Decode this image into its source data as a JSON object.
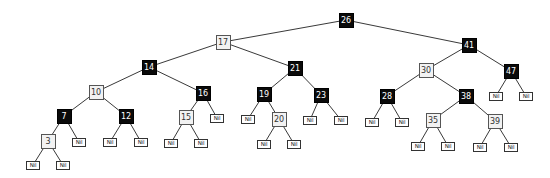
{
  "diagram": {
    "type": "red-black-tree",
    "colors": {
      "black": "#0a0a0a",
      "red_as_light": "#f2f2f2",
      "edge": "#222222"
    },
    "nodes": [
      {
        "id": "n26",
        "label": "26",
        "color": "black",
        "x": 346,
        "y": 20
      },
      {
        "id": "n17",
        "label": "17",
        "color": "red",
        "x": 223,
        "y": 42
      },
      {
        "id": "n41",
        "label": "41",
        "color": "black",
        "x": 469,
        "y": 45
      },
      {
        "id": "n14",
        "label": "14",
        "color": "black",
        "x": 149,
        "y": 67
      },
      {
        "id": "n21",
        "label": "21",
        "color": "black",
        "x": 295,
        "y": 68
      },
      {
        "id": "n30",
        "label": "30",
        "color": "red",
        "x": 426,
        "y": 70
      },
      {
        "id": "n47",
        "label": "47",
        "color": "black",
        "x": 511,
        "y": 71
      },
      {
        "id": "n10",
        "label": "10",
        "color": "red",
        "x": 96,
        "y": 92
      },
      {
        "id": "n16",
        "label": "16",
        "color": "black",
        "x": 203,
        "y": 93
      },
      {
        "id": "n19",
        "label": "19",
        "color": "black",
        "x": 264,
        "y": 94
      },
      {
        "id": "n23",
        "label": "23",
        "color": "black",
        "x": 321,
        "y": 95
      },
      {
        "id": "n28",
        "label": "28",
        "color": "black",
        "x": 387,
        "y": 96
      },
      {
        "id": "n38",
        "label": "38",
        "color": "black",
        "x": 466,
        "y": 96
      },
      {
        "id": "n7",
        "label": "7",
        "color": "black",
        "x": 64,
        "y": 116
      },
      {
        "id": "n12",
        "label": "12",
        "color": "black",
        "x": 126,
        "y": 116
      },
      {
        "id": "n15",
        "label": "15",
        "color": "red",
        "x": 186,
        "y": 117
      },
      {
        "id": "n20",
        "label": "20",
        "color": "red",
        "x": 279,
        "y": 119
      },
      {
        "id": "n35",
        "label": "35",
        "color": "red",
        "x": 433,
        "y": 120
      },
      {
        "id": "n39",
        "label": "39",
        "color": "red",
        "x": 495,
        "y": 121
      },
      {
        "id": "n3",
        "label": "3",
        "color": "red",
        "x": 48,
        "y": 141
      },
      {
        "id": "nil47l",
        "label": "Nil",
        "color": "nil",
        "x": 496,
        "y": 96
      },
      {
        "id": "nil47r",
        "label": "Nil",
        "color": "nil",
        "x": 526,
        "y": 96
      },
      {
        "id": "nil16r",
        "label": "Nil",
        "color": "nil",
        "x": 217,
        "y": 118
      },
      {
        "id": "nil19l",
        "label": "Nil",
        "color": "nil",
        "x": 248,
        "y": 119
      },
      {
        "id": "nil23l",
        "label": "Nil",
        "color": "nil",
        "x": 310,
        "y": 120
      },
      {
        "id": "nil23r",
        "label": "Nil",
        "color": "nil",
        "x": 341,
        "y": 120
      },
      {
        "id": "nil28l",
        "label": "Nil",
        "color": "nil",
        "x": 372,
        "y": 122
      },
      {
        "id": "nil28r",
        "label": "Nil",
        "color": "nil",
        "x": 402,
        "y": 122
      },
      {
        "id": "nil7r",
        "label": "Nil",
        "color": "nil",
        "x": 79,
        "y": 142
      },
      {
        "id": "nil12l",
        "label": "Nil",
        "color": "nil",
        "x": 110,
        "y": 142
      },
      {
        "id": "nil12r",
        "label": "Nil",
        "color": "nil",
        "x": 141,
        "y": 142
      },
      {
        "id": "nil15l",
        "label": "Nil",
        "color": "nil",
        "x": 171,
        "y": 143
      },
      {
        "id": "nil15r",
        "label": "Nil",
        "color": "nil",
        "x": 201,
        "y": 143
      },
      {
        "id": "nil20l",
        "label": "Nil",
        "color": "nil",
        "x": 264,
        "y": 144
      },
      {
        "id": "nil20r",
        "label": "Nil",
        "color": "nil",
        "x": 294,
        "y": 144
      },
      {
        "id": "nil35l",
        "label": "Nil",
        "color": "nil",
        "x": 418,
        "y": 146
      },
      {
        "id": "nil35r",
        "label": "Nil",
        "color": "nil",
        "x": 448,
        "y": 146
      },
      {
        "id": "nil39l",
        "label": "Nil",
        "color": "nil",
        "x": 480,
        "y": 147
      },
      {
        "id": "nil39r",
        "label": "Nil",
        "color": "nil",
        "x": 511,
        "y": 147
      },
      {
        "id": "nil3l",
        "label": "Nil",
        "color": "nil",
        "x": 33,
        "y": 165
      },
      {
        "id": "nil3r",
        "label": "Nil",
        "color": "nil",
        "x": 63,
        "y": 165
      }
    ],
    "edges": [
      [
        "n26",
        "n17"
      ],
      [
        "n26",
        "n41"
      ],
      [
        "n17",
        "n14"
      ],
      [
        "n17",
        "n21"
      ],
      [
        "n41",
        "n30"
      ],
      [
        "n41",
        "n47"
      ],
      [
        "n14",
        "n10"
      ],
      [
        "n14",
        "n16"
      ],
      [
        "n21",
        "n19"
      ],
      [
        "n21",
        "n23"
      ],
      [
        "n30",
        "n28"
      ],
      [
        "n30",
        "n38"
      ],
      [
        "n47",
        "nil47l"
      ],
      [
        "n47",
        "nil47r"
      ],
      [
        "n10",
        "n7"
      ],
      [
        "n10",
        "n12"
      ],
      [
        "n16",
        "n15"
      ],
      [
        "n16",
        "nil16r"
      ],
      [
        "n19",
        "nil19l"
      ],
      [
        "n19",
        "n20"
      ],
      [
        "n23",
        "nil23l"
      ],
      [
        "n23",
        "nil23r"
      ],
      [
        "n28",
        "nil28l"
      ],
      [
        "n28",
        "nil28r"
      ],
      [
        "n38",
        "n35"
      ],
      [
        "n38",
        "n39"
      ],
      [
        "n7",
        "n3"
      ],
      [
        "n7",
        "nil7r"
      ],
      [
        "n12",
        "nil12l"
      ],
      [
        "n12",
        "nil12r"
      ],
      [
        "n15",
        "nil15l"
      ],
      [
        "n15",
        "nil15r"
      ],
      [
        "n20",
        "nil20l"
      ],
      [
        "n20",
        "nil20r"
      ],
      [
        "n35",
        "nil35l"
      ],
      [
        "n35",
        "nil35r"
      ],
      [
        "n39",
        "nil39l"
      ],
      [
        "n39",
        "nil39r"
      ],
      [
        "n3",
        "nil3l"
      ],
      [
        "n3",
        "nil3r"
      ]
    ]
  }
}
